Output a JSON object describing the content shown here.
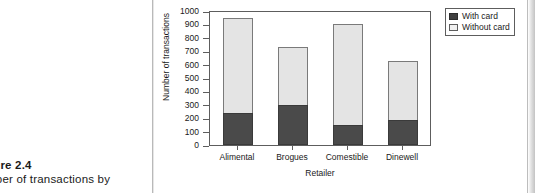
{
  "caption": {
    "figure_number": "gure 2.4",
    "figure_text": "mber of transactions by"
  },
  "chart_data": {
    "type": "bar",
    "stacked": true,
    "title": "",
    "xlabel": "Retailer",
    "ylabel": "Number of transactions",
    "categories": [
      "Alimental",
      "Brogues",
      "Comestible",
      "Dinewell"
    ],
    "series": [
      {
        "name": "With card",
        "values": [
          240,
          295,
          150,
          190
        ],
        "color": "#4a4a4a"
      },
      {
        "name": "Without card",
        "values": [
          705,
          435,
          755,
          435
        ],
        "color": "#e4e4e4"
      }
    ],
    "totals": [
      945,
      730,
      905,
      625
    ],
    "ylim": [
      0,
      1000
    ],
    "ytick_step": 100,
    "yticks": [
      0,
      100,
      200,
      300,
      400,
      500,
      600,
      700,
      800,
      900,
      1000
    ],
    "ytick_labels": [
      "0",
      "100",
      "200",
      "300",
      "400",
      "500",
      "600",
      "700",
      "800",
      "900",
      "1000"
    ],
    "grid": false,
    "legend_position": "top-right",
    "legend_entries": [
      "With card",
      "Without card"
    ]
  }
}
